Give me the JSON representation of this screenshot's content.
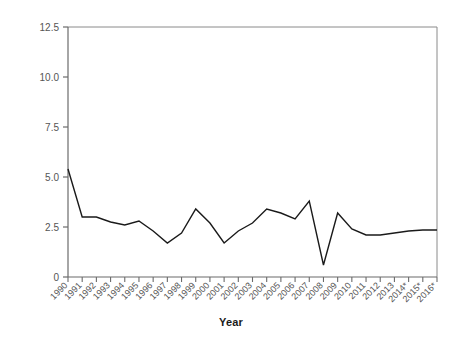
{
  "chart_data": {
    "type": "line",
    "title": "",
    "xlabel": "Year",
    "ylabel": "Inflation Rate",
    "x": [
      "1990",
      "1991",
      "1992",
      "1993",
      "1994",
      "1995",
      "1996",
      "1997",
      "1998",
      "1999",
      "2000",
      "2001",
      "2002",
      "2003",
      "2004",
      "2005",
      "2006",
      "2007",
      "2008",
      "2009",
      "2010",
      "2011",
      "2012",
      "2013",
      "2014*",
      "2015*",
      "2016*"
    ],
    "values": [
      5.4,
      3.0,
      3.0,
      2.75,
      2.6,
      2.8,
      2.3,
      1.7,
      2.2,
      3.4,
      2.7,
      1.7,
      2.3,
      2.7,
      3.4,
      3.2,
      2.9,
      3.8,
      0.6,
      3.2,
      2.4,
      2.1,
      2.1,
      2.2,
      2.3,
      2.35,
      2.35
    ],
    "series": [
      {
        "name": "Inflation Rate",
        "color": "#1a1a1a",
        "values": [
          5.4,
          3.0,
          3.0,
          2.75,
          2.6,
          2.8,
          2.3,
          1.7,
          2.2,
          3.4,
          2.7,
          1.7,
          2.3,
          2.7,
          3.4,
          3.2,
          2.9,
          3.8,
          0.6,
          3.2,
          2.4,
          2.1,
          2.1,
          2.2,
          2.3,
          2.35,
          2.35
        ]
      }
    ],
    "ylim": [
      0,
      12.5
    ],
    "y_ticks": [
      0,
      2.5,
      5.0,
      7.5,
      10.0,
      12.5
    ],
    "y_tick_labels": [
      "0",
      "2.5",
      "5.0",
      "7.5",
      "10.0",
      "12.5"
    ],
    "grid": false,
    "legend": "none",
    "line_color": "#1a1a1a",
    "axis_color": "#6b6b6b",
    "background": "#ffffff"
  }
}
